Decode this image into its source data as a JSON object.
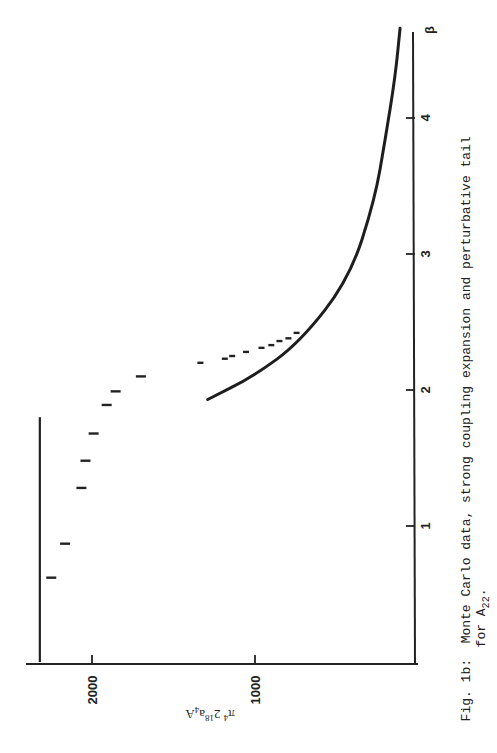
{
  "figure": {
    "caption_label": "Fig. 1b:",
    "caption_line1": "Monte Carlo data, strong coupling expansion and perturbative tail",
    "caption_line2_prefix": "for A",
    "caption_line2_sub": "22",
    "caption_line2_suffix": "."
  },
  "chart_data": {
    "type": "scatter",
    "orientation": "rotated 90° counter-clockwise (β axis runs vertically on right, value axis runs horizontally along bottom)",
    "xlabel": "β",
    "ylabel": "π⁴ 2¹⁸ a⁴ A",
    "xlim": [
      0,
      4.75
    ],
    "ylim": [
      0,
      2400
    ],
    "x_ticks": [
      1,
      2,
      3,
      4
    ],
    "x_tick_labels": [
      "1",
      "2",
      "3",
      "4"
    ],
    "y_ticks": [
      1000,
      2000
    ],
    "y_tick_labels": [
      "1000",
      "2000"
    ],
    "grid": false,
    "legend": null,
    "series": [
      {
        "name": "Monte Carlo data",
        "style": "short horizontal dashes (error bars)",
        "x": [
          0.62,
          0.87,
          1.28,
          1.48,
          1.68,
          1.89,
          1.99,
          2.1,
          2.2,
          2.23,
          2.25,
          2.28,
          2.31,
          2.33,
          2.36,
          2.38,
          2.42
        ],
        "y": [
          2250,
          2165,
          2065,
          2040,
          1990,
          1910,
          1855,
          1700,
          1335,
          1185,
          1140,
          1055,
          960,
          900,
          850,
          795,
          745
        ]
      },
      {
        "name": "Strong coupling expansion",
        "style": "solid line (constant)",
        "x": [
          0.0,
          1.8
        ],
        "y": [
          2320,
          2320
        ]
      },
      {
        "name": "Perturbative tail",
        "style": "solid curve",
        "x": [
          1.93,
          2.1,
          2.35,
          2.82,
          3.4,
          3.85,
          4.3,
          4.66
        ],
        "y": [
          1290,
          1010,
          725,
          420,
          265,
          200,
          140,
          110
        ]
      }
    ]
  },
  "axes": {
    "beta_label": "β",
    "value_label_main": "π",
    "value_label_sup1": "4",
    "value_label_mid": " 2",
    "value_label_sup2": "18",
    "value_label_a": "a",
    "value_label_sup3": "4",
    "value_label_end": "A",
    "beta_ticks": [
      "1",
      "2",
      "3",
      "4"
    ],
    "value_ticks": [
      "2000",
      "1000"
    ]
  }
}
